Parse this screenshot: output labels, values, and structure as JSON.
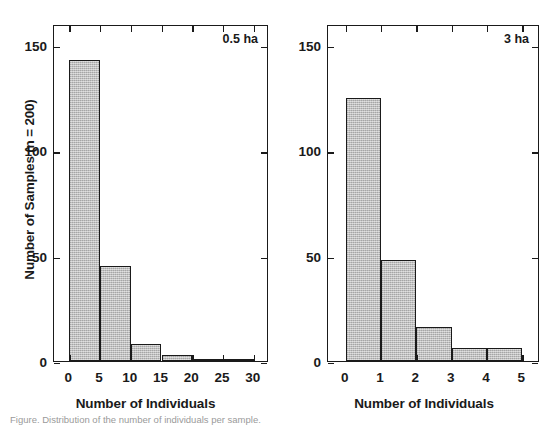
{
  "figure": {
    "width": 553,
    "height": 420,
    "background": "#ffffff",
    "bar_fill": "#b9b9b9",
    "bar_stroke": "#1a1a1a",
    "axis_color": "#1a1a1a",
    "shared_ylabel": "Number of Samples (n = 200)",
    "caption": "Figure. Distribution of the number of individuals per sample."
  },
  "chart_data": [
    {
      "type": "bar",
      "panel_id": "left",
      "title": "",
      "annotation": "0.5 ha",
      "xlabel": "Number of Individuals",
      "ylabel": "Number of Samples (n = 200)",
      "xlim": [
        -2.5,
        32.5
      ],
      "ylim": [
        0,
        160
      ],
      "xticks": [
        0,
        5,
        10,
        15,
        20,
        25,
        30
      ],
      "xticklabels": [
        "0",
        "5",
        "10",
        "15",
        "20",
        "25",
        "30"
      ],
      "yticks": [
        0,
        50,
        100,
        150
      ],
      "yticklabels": [
        "0",
        "50",
        "100",
        "150"
      ],
      "grid": false,
      "legend": null,
      "bin_width": 5,
      "bin_edges": [
        0,
        5,
        10,
        15,
        20,
        25,
        30
      ],
      "categories": [
        "0-5",
        "5-10",
        "10-15",
        "15-20",
        "20-25",
        "25-30"
      ],
      "values": [
        143,
        45,
        8,
        3,
        1,
        1
      ]
    },
    {
      "type": "bar",
      "panel_id": "right",
      "title": "",
      "annotation": "3 ha",
      "xlabel": "Number of Individuals",
      "ylabel": "Number of Samples (n = 200)",
      "xlim": [
        -0.5,
        5.5
      ],
      "ylim": [
        0,
        160
      ],
      "xticks": [
        0,
        1,
        2,
        3,
        4,
        5
      ],
      "xticklabels": [
        "0",
        "1",
        "2",
        "3",
        "4",
        "5"
      ],
      "yticks": [
        0,
        50,
        100,
        150
      ],
      "yticklabels": [
        "0",
        "50",
        "100",
        "150"
      ],
      "grid": false,
      "legend": null,
      "bin_width": 1,
      "bin_edges": [
        0,
        1,
        2,
        3,
        4,
        5
      ],
      "categories": [
        "0-1",
        "1-2",
        "2-3",
        "3-4",
        "4-5"
      ],
      "values": [
        125,
        48,
        16,
        6,
        6
      ]
    }
  ]
}
